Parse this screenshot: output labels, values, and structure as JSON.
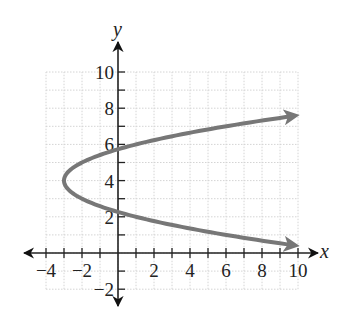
{
  "chart_data": {
    "type": "line",
    "title": "",
    "xlabel": "x",
    "ylabel": "y",
    "xlim": [
      -4,
      10
    ],
    "ylim": [
      -2,
      10
    ],
    "grid": true,
    "x_ticks": [
      -4,
      -2,
      2,
      4,
      6,
      8,
      10
    ],
    "y_ticks": [
      -2,
      2,
      4,
      6,
      8,
      10
    ],
    "x_tick_labels": [
      "−4",
      "−2",
      "2",
      "4",
      "6",
      "8",
      "10"
    ],
    "y_tick_labels": [
      "−2",
      "2",
      "4",
      "6",
      "8",
      "10"
    ],
    "series": [
      {
        "name": "x = (y − 4)² − 3",
        "description": "Horizontal parabola opening right, vertex (-3, 4), arrows at both ends",
        "vertex": [
          -3,
          4
        ],
        "color": "#777777",
        "points": [
          [
            10,
            7.6
          ],
          [
            6,
            7
          ],
          [
            1,
            6
          ],
          [
            -2,
            5
          ],
          [
            -3,
            4
          ],
          [
            -2,
            3
          ],
          [
            1,
            2
          ],
          [
            6,
            1
          ],
          [
            10,
            0.4
          ]
        ]
      }
    ]
  }
}
